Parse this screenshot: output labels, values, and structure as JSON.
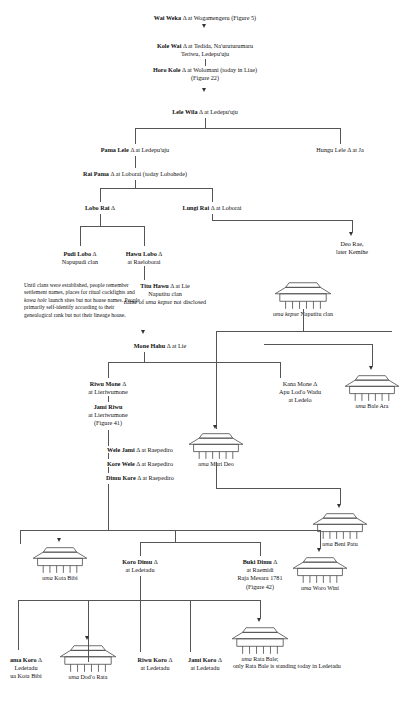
{
  "figure": {
    "type": "genealogy-chart",
    "title": "",
    "male_symbol": "Δ"
  },
  "note": {
    "text": "Until clans were established, people remember settlement names, places for ritual cockfights and kowa hole launch sites but not house names. People primarily self-identify according to their genealogical rank but not their lineage house.",
    "italic_term": "kowa hole"
  },
  "persons": {
    "wai_weka": {
      "name": "Wai Weka",
      "sym": "Δ",
      "rest": "at Wogamengeru (Figure 5)"
    },
    "kole_wai": {
      "name": "Kole Wai",
      "sym": "Δ",
      "rest": "at Tedida, Na'uruturumaru",
      "line2": "Teriwu, Ledepu'uju"
    },
    "horo_kole": {
      "name": "Horo Kole",
      "sym": "Δ",
      "rest": "at Wolomani (today in Liae)",
      "line2": "(Figure 22)"
    },
    "lele_wila": {
      "name": "Lele Wila",
      "sym": "Δ",
      "rest": "at Ledepu'uju"
    },
    "pama_lele": {
      "name": "Pama Lele",
      "sym": "Δ",
      "rest": "at Ledepu'uju"
    },
    "hungu_lele": {
      "name": "Hungu Lele",
      "sym": "Δ",
      "rest": "at Ja",
      "bold": false
    },
    "rai_pama": {
      "name": "Rai Pama",
      "sym": "Δ",
      "rest": "at Loborai (today Lobohede)"
    },
    "lobo_rai": {
      "name": "Lobo Rai",
      "sym": "Δ",
      "rest": ""
    },
    "lungi_rai": {
      "name": "Lungi Rai",
      "sym": "Δ",
      "rest": "at Loborai"
    },
    "deo_rae": {
      "name": "Deo Rae,",
      "sym": "",
      "rest": "",
      "line2": "later Kemihe",
      "bold": false
    },
    "pudi_lobo": {
      "name": "Pudi Lobo",
      "sym": "Δ",
      "rest": "",
      "line2": "Napupudi clan"
    },
    "hawu_lobo": {
      "name": "Hawu Lobo",
      "sym": "Δ",
      "rest": "",
      "line2": "at Raeloborai"
    },
    "titu_hawu": {
      "name": "Titu Hawu",
      "sym": "Δ",
      "rest": "at Lie",
      "line2": "Naputitu clan",
      "line3": "name of uma kepue not disclosed"
    },
    "mone_hahu": {
      "name": "Mone Hahu",
      "sym": "Δ",
      "rest": "at Lie"
    },
    "riwu_mone": {
      "name": "Riwu Mone",
      "sym": "Δ",
      "rest": "",
      "line2": "at Lieriwumone"
    },
    "jami_riwu": {
      "name": "Jami Riwu",
      "sym": "",
      "rest": "",
      "line2": "at Lieriwumone",
      "line3": "(Figure 41)"
    },
    "kana_mone": {
      "name": "Kana Mone",
      "sym": "Δ",
      "rest": "",
      "line2": "Apu Lod'o Wadu",
      "line3": "at Ledelo",
      "bold": false
    },
    "wele_jami": {
      "name": "Wele Jami",
      "sym": "Δ",
      "rest": "at Raepediro"
    },
    "kore_wele": {
      "name": "Kore Wele",
      "sym": "Δ",
      "rest": "at Raepediro"
    },
    "dimu_kore": {
      "name": "Dimu Kore",
      "sym": "Δ",
      "rest": "at Raepediro"
    },
    "koro_dimu": {
      "name": "Koro Dimu",
      "sym": "Δ",
      "rest": "",
      "line2": "at Ledetadu"
    },
    "buki_dimu": {
      "name": "Buki Dimu",
      "sym": "Δ",
      "rest": "",
      "line2": "at Raemidi",
      "line3": "Raja Mesara 1781",
      "line4": "(Figure 42)"
    },
    "ama_koro": {
      "name": "ama Koro",
      "sym": "Δ",
      "rest": "",
      "line2": "Ledetadu",
      "line3": "ua Kota Bibi",
      "clipped": true
    },
    "riwu_koro": {
      "name": "Riwu Koro",
      "sym": "Δ",
      "rest": "",
      "line2": "at Ledetadu"
    },
    "jami_koro": {
      "name": "Jami Koro",
      "sym": "Δ",
      "rest": "",
      "line2": "at Ledetadu"
    }
  },
  "houses": [
    {
      "id": "uma_kepue",
      "label_italic": "uma kepue",
      "label_rest": " Naputitu clan"
    },
    {
      "id": "uma_muri_deo",
      "label_italic": "uma",
      "label_rest": " Muri Deo"
    },
    {
      "id": "uma_bale_ara",
      "label_italic": "uma",
      "label_rest": " Bale Ara"
    },
    {
      "id": "uma_beni_patu",
      "label_italic": "uma",
      "label_rest": " Beni Patu"
    },
    {
      "id": "uma_kota_bibi",
      "label_italic": "uma",
      "label_rest": " Kota Bibi"
    },
    {
      "id": "uma_woro_wini",
      "label_italic": "uma",
      "label_rest": " Woro Wini"
    },
    {
      "id": "uma_dodo_rata",
      "label_italic": "uma",
      "label_rest": " Dod'o Rata"
    },
    {
      "id": "uma_rata_bale",
      "label_italic": "uma",
      "label_rest": " Rata Bale;",
      "line2": "only Rata Bale is standing today in Ledetadu"
    }
  ]
}
